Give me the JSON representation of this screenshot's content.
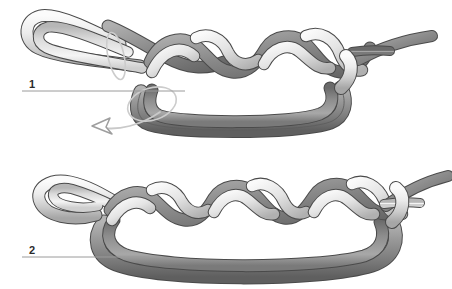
{
  "figure": {
    "background_color": "#ffffff",
    "step_count": 2
  },
  "palette": {
    "dark_strand_light": "#a9a9a9",
    "dark_strand_mid": "#8a8a8a",
    "dark_strand_dark": "#636363",
    "light_strand_light": "#f2f2f2",
    "light_strand_mid": "#dcdcdc",
    "light_strand_dark": "#a8a8a8",
    "outline": "#4a4a4a",
    "leader_line": "#9a9a9a",
    "arrow_line": "#cfcfcf",
    "arrow_outline": "#9a9a9a",
    "label_text": "#2b2b2b"
  },
  "steps": [
    {
      "id": "step-1",
      "number": "1",
      "label_x": 32,
      "label_y": 88,
      "leader": {
        "x1": 22,
        "y1": 91,
        "x2": 185,
        "y2": 91
      },
      "braid_crossings": 4,
      "has_motion_arrow": true,
      "has_loop_guide": true,
      "description": "Braided sennit with doubled standing part forming a large bight below; curved arrow indicates pulling the bight to the left."
    },
    {
      "id": "step-2",
      "number": "2",
      "label_x": 32,
      "label_y": 254,
      "leader": {
        "x1": 22,
        "y1": 257,
        "x2": 150,
        "y2": 257
      },
      "braid_crossings": 6,
      "has_motion_arrow": false,
      "has_loop_guide": false,
      "description": "Completed longer braid with the doubled standing part drawn snug beneath."
    }
  ],
  "annotations": {
    "arrow_name": "motion-arrow",
    "arrow_direction": "left",
    "arrow_style": "hollow-outline",
    "loop_guide_name": "rotation-guide-loop"
  }
}
